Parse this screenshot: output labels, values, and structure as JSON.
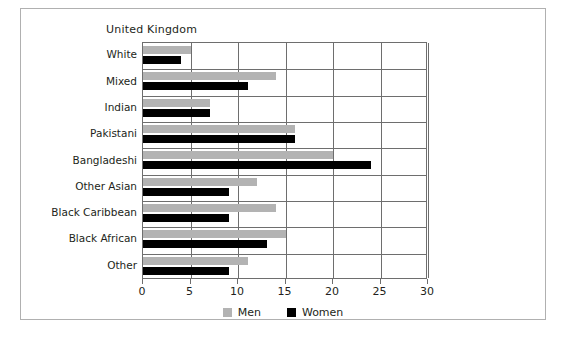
{
  "figure": {
    "title": "United Kingdom",
    "border_color": "#b0b0b0"
  },
  "legend": {
    "position": "bottom-center",
    "items": [
      {
        "label": "Men",
        "color": "#b3b3b3",
        "swatch_name": "men-swatch"
      },
      {
        "label": "Women",
        "color": "#000000",
        "swatch_name": "women-swatch"
      }
    ]
  },
  "axis": {
    "ticks": [
      "0",
      "5",
      "10",
      "15",
      "20",
      "25",
      "30"
    ]
  },
  "chart_data": {
    "type": "bar",
    "orientation": "horizontal",
    "title": "United Kingdom",
    "xlabel": "",
    "ylabel": "",
    "xlim": [
      0,
      30
    ],
    "xticks": [
      0,
      5,
      10,
      15,
      20,
      25,
      30
    ],
    "grid": true,
    "legend_position": "bottom-center",
    "categories": [
      "White",
      "Mixed",
      "Indian",
      "Pakistani",
      "Bangladeshi",
      "Other Asian",
      "Black Caribbean",
      "Black African",
      "Other"
    ],
    "series": [
      {
        "name": "Men",
        "color": "#b3b3b3",
        "values": [
          5,
          14,
          7,
          16,
          20,
          12,
          14,
          15,
          11
        ]
      },
      {
        "name": "Women",
        "color": "#000000",
        "values": [
          4,
          11,
          7,
          16,
          24,
          9,
          9,
          13,
          9
        ]
      }
    ]
  }
}
